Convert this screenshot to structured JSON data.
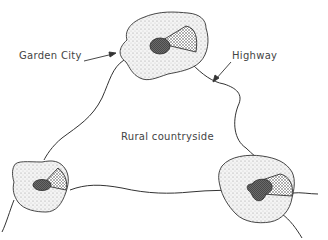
{
  "diagram": {
    "labels": {
      "garden_city": "Garden City",
      "highway": "Highway",
      "rural": "Rural countryside"
    },
    "nodes": [
      {
        "name": "top-city",
        "role": "Garden City"
      },
      {
        "name": "left-city"
      },
      {
        "name": "right-city"
      }
    ],
    "colors": {
      "ink": "#333333",
      "stipple": "#cfcfcf",
      "core": "#555555"
    }
  }
}
